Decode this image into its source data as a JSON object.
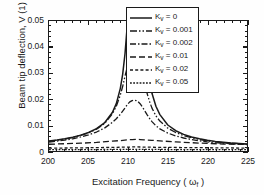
{
  "chart_data": {
    "type": "line",
    "title": "",
    "xlabel": "Excitation Frequency ( ωf )",
    "xlabel_main": "Excitation Frequency ( ",
    "xlabel_sub": "f",
    "xlabel_omega": "ω",
    "xlabel_close": " )",
    "ylabel": "Beam tip deflection, V (1)",
    "xlim": [
      200,
      225
    ],
    "ylim": [
      0,
      0.05
    ],
    "xticks": [
      200,
      205,
      210,
      215,
      220,
      225
    ],
    "xtick_labels": [
      "200",
      "205",
      "210",
      "215",
      "220",
      "225"
    ],
    "yticks": [
      0,
      0.01,
      0.02,
      0.03,
      0.04,
      0.05
    ],
    "ytick_labels": [
      "0",
      "0.01",
      "0.02",
      "0.03",
      "0.04",
      "0.05"
    ],
    "x_minor_per_major": 5,
    "y_minor_per_major": 5,
    "grid": false,
    "legend_position": "upper right",
    "frame_color": "#1a1a1a",
    "series": [
      {
        "name": "K_v = 0",
        "label": "K",
        "label_sub": "v",
        "label_rest": " = 0",
        "dash": "none",
        "dasharray": "",
        "width": 1.5,
        "color": "#1a1a1a",
        "peak_x": 211,
        "peak_y": 0.085,
        "clipped_above_axis": true,
        "x": [
          200,
          201,
          202,
          203,
          204,
          205,
          206,
          207,
          208,
          208.5,
          209,
          209.3,
          209.6,
          209.9,
          210.2,
          210.5,
          210.8,
          211,
          211.2,
          211.5,
          211.8,
          212.1,
          212.4,
          212.7,
          213,
          213.5,
          214,
          215,
          216,
          217,
          218,
          219,
          220,
          221,
          222,
          223,
          224,
          225
        ],
        "y": [
          0.0038,
          0.0042,
          0.0047,
          0.0053,
          0.0061,
          0.0071,
          0.0086,
          0.0108,
          0.0148,
          0.0182,
          0.024,
          0.0295,
          0.0375,
          0.049,
          0.064,
          0.076,
          0.084,
          0.085,
          0.082,
          0.07,
          0.055,
          0.042,
          0.033,
          0.0268,
          0.0222,
          0.0172,
          0.014,
          0.01,
          0.0078,
          0.0064,
          0.0054,
          0.0047,
          0.0041,
          0.0037,
          0.0034,
          0.0031,
          0.0029,
          0.0027
        ]
      },
      {
        "name": "K_v = 0.001",
        "label": "K",
        "label_sub": "v",
        "label_rest": " = 0.001",
        "dash": "dashdotdot",
        "dasharray": "7,2,1.5,2,1.5,2",
        "width": 1.3,
        "color": "#1a1a1a",
        "peak_x": 211,
        "peak_y": 0.0375,
        "clipped_above_axis": false,
        "x": [
          200,
          201,
          202,
          203,
          204,
          205,
          206,
          207,
          208,
          208.5,
          209,
          209.3,
          209.6,
          209.9,
          210.2,
          210.5,
          210.8,
          211,
          211.2,
          211.5,
          211.8,
          212.1,
          212.4,
          212.7,
          213,
          213.5,
          214,
          215,
          216,
          217,
          218,
          219,
          220,
          221,
          222,
          223,
          224,
          225
        ],
        "y": [
          0.0037,
          0.0041,
          0.0046,
          0.0052,
          0.006,
          0.007,
          0.0084,
          0.0105,
          0.0143,
          0.0172,
          0.0215,
          0.0248,
          0.0288,
          0.0325,
          0.0358,
          0.0372,
          0.0375,
          0.0374,
          0.0366,
          0.034,
          0.03,
          0.0258,
          0.022,
          0.019,
          0.0165,
          0.0135,
          0.0115,
          0.0088,
          0.0071,
          0.0059,
          0.0051,
          0.0044,
          0.0039,
          0.0035,
          0.0032,
          0.003,
          0.0028,
          0.0026
        ]
      },
      {
        "name": "K_v = 0.002",
        "label": "K",
        "label_sub": "v",
        "label_rest": " = 0.002",
        "dash": "dashdot",
        "dasharray": "6,2,1.5,2",
        "width": 1.3,
        "color": "#1a1a1a",
        "peak_x": 211,
        "peak_y": 0.0195,
        "clipped_above_axis": false,
        "x": [
          200,
          201,
          202,
          203,
          204,
          205,
          206,
          207,
          208,
          208.5,
          209,
          209.3,
          209.6,
          209.9,
          210.2,
          210.5,
          210.8,
          211,
          211.2,
          211.5,
          211.8,
          212.1,
          212.4,
          212.7,
          213,
          213.5,
          214,
          215,
          216,
          217,
          218,
          219,
          220,
          221,
          222,
          223,
          224,
          225
        ],
        "y": [
          0.0034,
          0.0038,
          0.0042,
          0.0047,
          0.0054,
          0.0062,
          0.0073,
          0.0088,
          0.011,
          0.0124,
          0.0141,
          0.0153,
          0.0166,
          0.0179,
          0.0189,
          0.0194,
          0.0195,
          0.0194,
          0.0191,
          0.0182,
          0.0169,
          0.0154,
          0.0139,
          0.0125,
          0.0113,
          0.0097,
          0.0085,
          0.0069,
          0.0058,
          0.005,
          0.0044,
          0.0039,
          0.0035,
          0.0032,
          0.003,
          0.0028,
          0.0026,
          0.0025
        ]
      },
      {
        "name": "K_v = 0.01",
        "label": "K",
        "label_sub": "v",
        "label_rest": " = 0.01",
        "dash": "dashed",
        "dasharray": "6,3",
        "width": 1.3,
        "color": "#1a1a1a",
        "peak_x": 211,
        "peak_y": 0.0045,
        "clipped_above_axis": false,
        "x": [
          200,
          202,
          204,
          206,
          208,
          209,
          210,
          210.5,
          211,
          211.5,
          212,
          213,
          214,
          216,
          218,
          220,
          222,
          225
        ],
        "y": [
          0.0026,
          0.0028,
          0.003,
          0.0033,
          0.0038,
          0.004,
          0.0043,
          0.0044,
          0.0045,
          0.0044,
          0.0043,
          0.0041,
          0.0039,
          0.0035,
          0.0032,
          0.0029,
          0.0027,
          0.0025
        ]
      },
      {
        "name": "K_v = 0.02",
        "label": "K",
        "label_sub": "v",
        "label_rest": " = 0.02",
        "dash": "dotted-coarse",
        "dasharray": "3,2.2",
        "width": 1.3,
        "color": "#1a1a1a",
        "peak_x": 211,
        "peak_y": 0.0016,
        "clipped_above_axis": false,
        "x": [
          200,
          204,
          208,
          210,
          211,
          212,
          214,
          218,
          222,
          225
        ],
        "y": [
          0.0011,
          0.0012,
          0.0014,
          0.0015,
          0.0016,
          0.0015,
          0.0014,
          0.0013,
          0.0012,
          0.0011
        ]
      },
      {
        "name": "K_v = 0.05",
        "label": "K",
        "label_sub": "v",
        "label_rest": " = 0.05",
        "dash": "dotted-fine",
        "dasharray": "1.8,1.4",
        "width": 1.3,
        "color": "#1a1a1a",
        "peak_x": 211,
        "peak_y": 0.0006,
        "clipped_above_axis": false,
        "x": [
          200,
          204,
          208,
          210,
          211,
          212,
          214,
          218,
          222,
          225
        ],
        "y": [
          0.0005,
          0.0005,
          0.0006,
          0.0006,
          0.0006,
          0.0006,
          0.0006,
          0.0005,
          0.0005,
          0.0005
        ]
      }
    ]
  }
}
